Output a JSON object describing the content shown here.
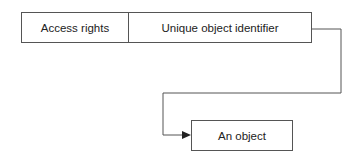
{
  "capability": {
    "fields": [
      {
        "label": "Access rights"
      },
      {
        "label": "Unique object identifier"
      }
    ]
  },
  "target": {
    "label": "An object"
  },
  "connector": {
    "from": "Unique object identifier",
    "to": "An object",
    "arrow": "arrow-right-icon",
    "color": "#555555"
  }
}
